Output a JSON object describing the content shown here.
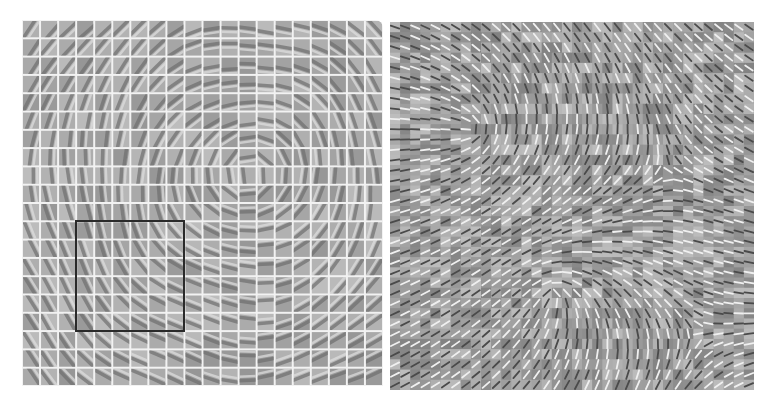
{
  "figure": {
    "panels": [
      {
        "id": "left",
        "description": "Grid of learned filter patches arranged topographically, separated by white gridlines",
        "grid": {
          "cols": 20,
          "rows": 20
        },
        "gap_color": "#f2f2f2",
        "base_gray": "#a8a8a8",
        "highlight_box": {
          "col_start": 3,
          "row_start": 11,
          "cols": 6,
          "rows": 6,
          "color": "#2a2a2a"
        }
      },
      {
        "id": "right",
        "description": "Dense grid of oriented Gabor-like filters with swirling orientation map, no gridline gaps",
        "grid": {
          "cols": 36,
          "rows": 36
        },
        "base_gray": "#9a9a9a"
      }
    ],
    "colors": {
      "background": "#ffffff",
      "dark_stroke": "#4a4a4a",
      "light_stroke": "#eeeeee"
    }
  }
}
